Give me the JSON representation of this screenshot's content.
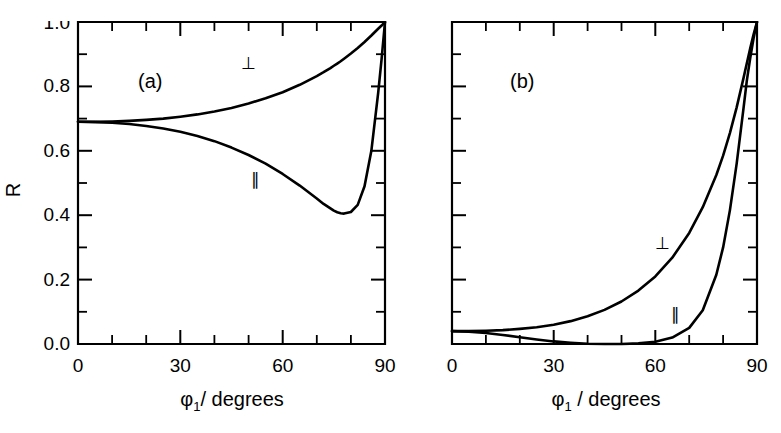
{
  "figure": {
    "background_color": "#ffffff",
    "ink_color": "#000000",
    "width": 781,
    "height": 433
  },
  "chart_data": [
    {
      "type": "line",
      "panel_tag": "(a)",
      "title": "",
      "xlabel": "φ₁/ degrees",
      "ylabel": "R",
      "xlim": [
        0,
        90
      ],
      "ylim": [
        0.0,
        1.0
      ],
      "grid": false,
      "legend_position": "inline-annotation",
      "x_ticks_major": [
        0,
        30,
        60,
        90
      ],
      "x_ticklabels": [
        "0",
        "30",
        "60",
        "90"
      ],
      "x_ticks_minor": [
        10,
        20,
        40,
        50,
        70,
        80
      ],
      "y_ticks_major": [
        0.0,
        0.2,
        0.4,
        0.6,
        0.8,
        1.0
      ],
      "y_ticklabels": [
        "0.0",
        "0.2",
        "0.4",
        "0.6",
        "0.8",
        "1.0"
      ],
      "y_ticks_minor": [
        0.1,
        0.3,
        0.5,
        0.7,
        0.9
      ],
      "x": [
        0,
        5,
        10,
        15,
        20,
        25,
        30,
        35,
        40,
        45,
        50,
        55,
        60,
        65,
        70,
        72,
        74,
        75,
        76,
        77,
        78,
        80,
        82,
        84,
        86,
        88,
        89,
        90
      ],
      "series": [
        {
          "name": "⊥",
          "label": "perpendicular",
          "annotation_x": 50,
          "annotation_y": 0.855,
          "values": [
            0.69,
            0.69,
            0.691,
            0.693,
            0.696,
            0.7,
            0.706,
            0.713,
            0.722,
            0.733,
            0.747,
            0.763,
            0.782,
            0.805,
            0.832,
            0.844,
            0.857,
            0.864,
            0.871,
            0.878,
            0.886,
            0.902,
            0.919,
            0.938,
            0.958,
            0.979,
            0.989,
            1.0
          ]
        },
        {
          "name": "∥",
          "label": "parallel",
          "annotation_x": 52,
          "annotation_y": 0.495,
          "values": [
            0.69,
            0.689,
            0.687,
            0.683,
            0.677,
            0.669,
            0.659,
            0.646,
            0.63,
            0.61,
            0.587,
            0.56,
            0.528,
            0.492,
            0.452,
            0.435,
            0.421,
            0.414,
            0.409,
            0.406,
            0.405,
            0.41,
            0.432,
            0.49,
            0.6,
            0.78,
            0.885,
            1.0
          ]
        }
      ]
    },
    {
      "type": "line",
      "panel_tag": "(b)",
      "title": "",
      "xlabel": "φ₁ / degrees",
      "ylabel": "",
      "xlim": [
        0,
        90
      ],
      "ylim": [
        0.0,
        1.0
      ],
      "grid": false,
      "legend_position": "inline-annotation",
      "x_ticks_major": [
        0,
        30,
        60,
        90
      ],
      "x_ticklabels": [
        "0",
        "30",
        "60",
        "90"
      ],
      "x_ticks_minor": [
        10,
        20,
        40,
        50,
        70,
        80
      ],
      "y_ticks_major": [
        0.0,
        0.2,
        0.4,
        0.6,
        0.8,
        1.0
      ],
      "y_ticklabels": [
        "",
        "",
        "",
        "",
        "",
        ""
      ],
      "y_ticks_minor": [
        0.1,
        0.3,
        0.5,
        0.7,
        0.9
      ],
      "x": [
        0,
        5,
        10,
        15,
        20,
        25,
        30,
        35,
        40,
        45,
        50,
        55,
        60,
        65,
        70,
        74,
        78,
        80,
        82,
        84,
        86,
        87,
        88,
        89,
        90
      ],
      "series": [
        {
          "name": "⊥",
          "label": "perpendicular",
          "annotation_x": 62,
          "annotation_y": 0.295,
          "values": [
            0.04,
            0.04,
            0.041,
            0.043,
            0.047,
            0.052,
            0.06,
            0.071,
            0.086,
            0.106,
            0.132,
            0.166,
            0.21,
            0.268,
            0.345,
            0.425,
            0.525,
            0.585,
            0.655,
            0.735,
            0.825,
            0.872,
            0.918,
            0.962,
            1.0
          ]
        },
        {
          "name": "∥",
          "label": "parallel",
          "annotation_x": 66,
          "annotation_y": 0.075,
          "values": [
            0.04,
            0.038,
            0.034,
            0.028,
            0.021,
            0.014,
            0.008,
            0.004,
            0.001,
            0.0,
            0.0,
            0.002,
            0.007,
            0.02,
            0.05,
            0.105,
            0.215,
            0.3,
            0.415,
            0.56,
            0.73,
            0.818,
            0.888,
            0.95,
            1.0
          ]
        }
      ]
    }
  ]
}
